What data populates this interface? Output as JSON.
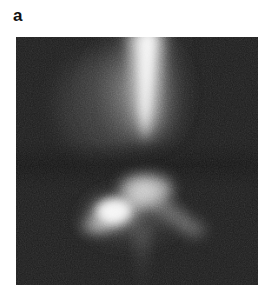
{
  "figure": {
    "panel_label": "a",
    "label_color": "#111111",
    "page_background": "#ffffff"
  },
  "micrograph": {
    "alt_text": "Grayscale micrograph panel a",
    "frame": {
      "x": 16,
      "y": 37,
      "width": 242,
      "height": 248
    },
    "background_color": "#1d1d1d",
    "highlight_color": "#f2f2f2",
    "midtone_color": "#8a8a8a",
    "noise": {
      "grain": "fine",
      "opacity": 0.42,
      "seed": 7
    },
    "features": [
      {
        "id": "upper-vertical-streak",
        "description": "Bright vertical streak descending from the top edge, tapering to a point near mid-frame",
        "shape": "tapered-streak",
        "top": {
          "x": 129,
          "y": 0
        },
        "bottom_tip": {
          "x": 125,
          "y": 113
        },
        "top_width": 30,
        "peak_intensity": 0.98
      },
      {
        "id": "upper-streak-halo",
        "description": "Diffuse glow flanking the upper streak, broader on the left",
        "shape": "radial-glow",
        "center": {
          "x": 120,
          "y": 55
        },
        "radius_x": 62,
        "radius_y": 72,
        "peak_intensity": 0.42
      },
      {
        "id": "lower-chevron",
        "description": "Inverted-V chevron with apex just below the gap",
        "shape": "chevron",
        "apex": {
          "x": 128,
          "y": 148
        },
        "left_arm_end": {
          "x": 72,
          "y": 188
        },
        "right_arm_end": {
          "x": 186,
          "y": 196
        },
        "peak_intensity": 0.88
      },
      {
        "id": "lower-left-blob",
        "description": "Brightest compact blob on the left arm of the chevron",
        "shape": "radial-glow",
        "center": {
          "x": 96,
          "y": 176
        },
        "radius_x": 30,
        "radius_y": 20,
        "peak_intensity": 1.0
      },
      {
        "id": "lower-tail",
        "description": "Faint vertical wisp trailing from the chevron apex to the bottom edge",
        "shape": "tapered-streak",
        "top": {
          "x": 126,
          "y": 196
        },
        "bottom_tip": {
          "x": 124,
          "y": 248
        },
        "top_width": 12,
        "peak_intensity": 0.3
      },
      {
        "id": "dark-gap",
        "description": "Dark band separating the upper streak from the lower chevron",
        "shape": "band",
        "y_range": [
          112,
          146
        ],
        "peak_intensity": 0.05
      }
    ]
  }
}
